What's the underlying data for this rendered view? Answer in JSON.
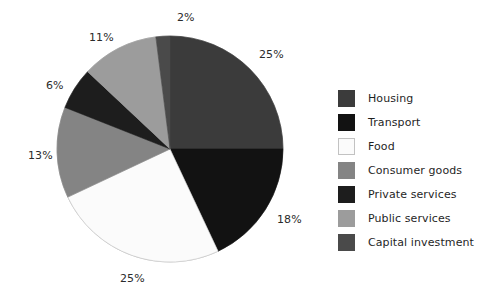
{
  "chart_data": {
    "type": "pie",
    "title": "",
    "labels": [
      "Housing",
      "Transport",
      "Food",
      "Consumer goods",
      "Private services",
      "Public services",
      "Capital investment"
    ],
    "values": [
      25,
      18,
      25,
      13,
      6,
      11,
      2
    ],
    "value_labels": [
      "25%",
      "18%",
      "25%",
      "13%",
      "6%",
      "11%",
      "2%"
    ],
    "unit": "%",
    "start_angle_deg": 0,
    "direction": "clockwise",
    "colors": [
      "#3b3b3b",
      "#121212",
      "#fbfbfb",
      "#848484",
      "#1d1d1d",
      "#9c9c9c",
      "#4a4a4a"
    ],
    "legend_position": "right",
    "grid": false,
    "label_positions": [
      {
        "text": "25%",
        "x": 259,
        "y": 48
      },
      {
        "text": "18%",
        "x": 277,
        "y": 213
      },
      {
        "text": "25%",
        "x": 120,
        "y": 272
      },
      {
        "text": "13%",
        "x": 28,
        "y": 149
      },
      {
        "text": "6%",
        "x": 46,
        "y": 79
      },
      {
        "text": "11%",
        "x": 89,
        "y": 31
      },
      {
        "text": "2%",
        "x": 177,
        "y": 11
      }
    ]
  },
  "pie": {
    "center_x": 170,
    "center_y": 149,
    "radius": 113,
    "outline_color": "#c8c8c8"
  },
  "legend": {
    "items": [
      {
        "label": "Housing",
        "color": "#3b3b3b",
        "border": "#3b3b3b"
      },
      {
        "label": "Transport",
        "color": "#121212",
        "border": "#121212"
      },
      {
        "label": "Food",
        "color": "#fbfbfb",
        "border": "#c2c2c2"
      },
      {
        "label": "Consumer goods",
        "color": "#848484",
        "border": "#848484"
      },
      {
        "label": "Private services",
        "color": "#1d1d1d",
        "border": "#1d1d1d"
      },
      {
        "label": "Public services",
        "color": "#9c9c9c",
        "border": "#9c9c9c"
      },
      {
        "label": "Capital investment",
        "color": "#4a4a4a",
        "border": "#4a4a4a"
      }
    ]
  }
}
